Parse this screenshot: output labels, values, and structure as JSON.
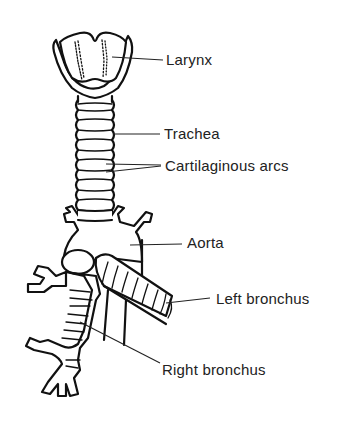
{
  "figure": {
    "labels": [
      {
        "id": "larynx",
        "text": "Larynx"
      },
      {
        "id": "trachea",
        "text": "Trachea"
      },
      {
        "id": "cartilaginous-arcs",
        "text": "Cartilaginous arcs"
      },
      {
        "id": "aorta",
        "text": "Aorta"
      },
      {
        "id": "left-bronchus",
        "text": "Left bronchus"
      },
      {
        "id": "right-bronchus",
        "text": "Right bronchus"
      }
    ],
    "colors": {
      "line": "#111111",
      "text": "#222222",
      "background": "#ffffff"
    }
  }
}
